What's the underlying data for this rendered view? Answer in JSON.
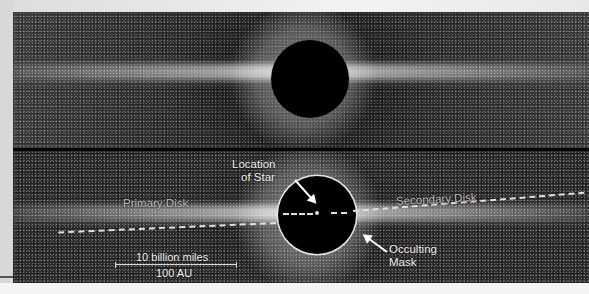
{
  "image": {
    "description": "Coronagraph image of a circumstellar debris disk shown edge-on, two panels: raw (top) and annotated (bottom)",
    "colors": {
      "background": "#e6e6e6",
      "noise_base": "#2a2a2a",
      "mask": "#000000",
      "annotation": "#f2f2f2",
      "divider": "#050505"
    }
  },
  "annotations": {
    "location_of_star": {
      "line1": "Location",
      "line2": "of Star"
    },
    "primary_disk": "Primary Disk",
    "secondary_disk": "Secondary Disk",
    "occulting_mask": {
      "line1": "Occulting",
      "line2": "Mask"
    },
    "scale_bar": {
      "top_label": "10 billion miles",
      "bottom_label": "100 AU"
    }
  }
}
